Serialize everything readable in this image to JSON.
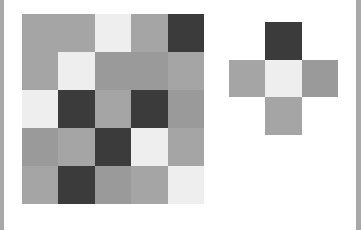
{
  "palette": {
    "G": "#a5a5a5",
    "G2": "#9a9a9a",
    "L": "#eeeeee",
    "D": "#3b3b3b",
    "E": "transparent"
  },
  "board": {
    "rows": 5,
    "cols": 5,
    "cells": [
      [
        "G",
        "G",
        "L",
        "G",
        "D"
      ],
      [
        "G",
        "L",
        "G2",
        "G2",
        "G"
      ],
      [
        "L",
        "D",
        "G",
        "D",
        "G2"
      ],
      [
        "G2",
        "G",
        "D",
        "L",
        "G"
      ],
      [
        "G",
        "D",
        "G2",
        "G",
        "L"
      ]
    ]
  },
  "piece": {
    "rows": 3,
    "cols": 3,
    "cells": [
      [
        "E",
        "D",
        "E"
      ],
      [
        "G",
        "L",
        "G2"
      ],
      [
        "E",
        "G",
        "E"
      ]
    ]
  }
}
